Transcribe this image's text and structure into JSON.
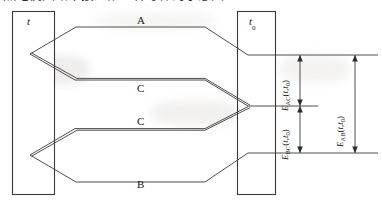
{
  "caption": {
    "text": "热电偶回路中接入第三种导体的示意图"
  },
  "figure": {
    "type": "thermocouple-circuit-diagram",
    "line_color": "#3a3a3a",
    "text_color": "#1a1a1a",
    "background": "#ffffff"
  },
  "temperature_zones": [
    {
      "id": "hot-junction-zone",
      "label": "t",
      "position": "left"
    },
    {
      "id": "reference-junction-zone",
      "label": "t",
      "subscript": "0",
      "position": "right"
    }
  ],
  "conductors": [
    {
      "id": "conductor-a",
      "label": "A",
      "row": "top"
    },
    {
      "id": "conductor-c-upper",
      "label": "C",
      "row": "upper-middle"
    },
    {
      "id": "conductor-c-lower",
      "label": "C",
      "row": "lower-middle"
    },
    {
      "id": "conductor-b",
      "label": "B",
      "row": "bottom"
    }
  ],
  "emf_measurements": [
    {
      "id": "emf-ac",
      "symbol": "E",
      "subscript": "AC",
      "argument": "(t,t0)",
      "display": "EAC(t,t0)",
      "span": "upper"
    },
    {
      "id": "emf-bc",
      "symbol": "E",
      "subscript": "BC",
      "argument": "(t,t0)",
      "display": "EBC(t,t0)",
      "span": "lower"
    },
    {
      "id": "emf-ab",
      "symbol": "E",
      "subscript": "AB",
      "argument": "(t,t0)",
      "display": "EAB(t,t0)",
      "span": "total"
    }
  ]
}
